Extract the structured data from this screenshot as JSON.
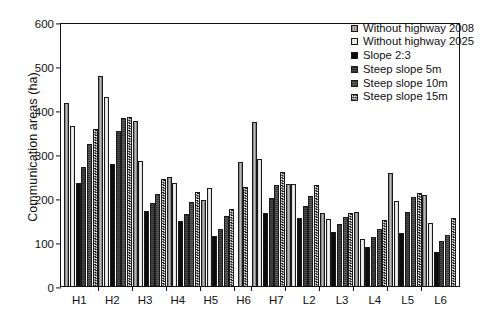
{
  "chart_data": {
    "type": "bar",
    "title": "",
    "xlabel": "",
    "ylabel": "Communication areas (ha)",
    "ylim": [
      0,
      600
    ],
    "ytick_values": [
      0,
      100,
      200,
      300,
      400,
      500,
      600
    ],
    "ytick_labels": [
      "0",
      "100",
      "200",
      "300",
      "400",
      "500",
      "600"
    ],
    "grid": false,
    "legend_position": "top-right",
    "categories": [
      "H1",
      "H2",
      "H3",
      "H4",
      "H5",
      "H6",
      "H7",
      "L2",
      "L3",
      "L4",
      "L5",
      "L6"
    ],
    "series": [
      {
        "name": "Without highway 2008",
        "values": [
          417,
          478,
          375,
          248,
          196,
          281,
          373,
          232,
          165,
          168,
          256,
          207
        ]
      },
      {
        "name": "Without highway 2025",
        "values": [
          363,
          430,
          284,
          233,
          222,
          null,
          289,
          231,
          152,
          107,
          193,
          144
        ]
      },
      {
        "name": "Slope 2:3",
        "values": [
          233,
          277,
          171,
          148,
          114,
          null,
          167,
          154,
          122,
          88,
          121,
          77
        ]
      },
      {
        "name": "Steep slope 5m",
        "values": [
          270,
          353,
          188,
          163,
          130,
          null,
          200,
          181,
          140,
          111,
          169,
          102
        ]
      },
      {
        "name": "Steep slope 10m",
        "values": [
          322,
          382,
          210,
          192,
          159,
          null,
          230,
          205,
          157,
          129,
          203,
          116
        ]
      },
      {
        "name": "Steep slope 15m",
        "values": [
          357,
          383,
          243,
          214,
          176,
          225,
          259,
          229,
          166,
          149,
          212,
          155
        ]
      }
    ]
  },
  "legend": {
    "items": [
      {
        "label": "Without highway 2008"
      },
      {
        "label": "Without highway 2025"
      },
      {
        "label": "Slope 2:3"
      },
      {
        "label": "Steep slope 5m"
      },
      {
        "label": "Steep slope 10m"
      },
      {
        "label": "Steep slope 15m"
      }
    ]
  }
}
